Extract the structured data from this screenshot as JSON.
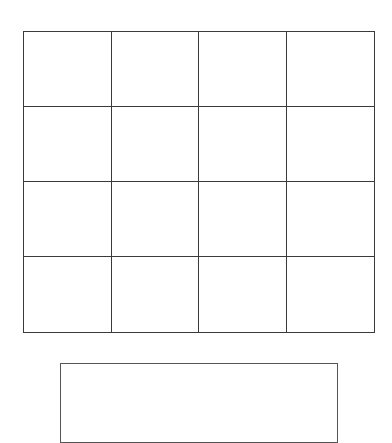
{
  "grid": {
    "rows": 4,
    "columns": 4,
    "cells": [
      [
        "",
        "",
        "",
        ""
      ],
      [
        "",
        "",
        "",
        ""
      ],
      [
        "",
        "",
        "",
        ""
      ],
      [
        "",
        "",
        "",
        ""
      ]
    ],
    "line_color": "#3a3a3a"
  },
  "bottom_box": {
    "text": "",
    "border_color": "#555555"
  }
}
